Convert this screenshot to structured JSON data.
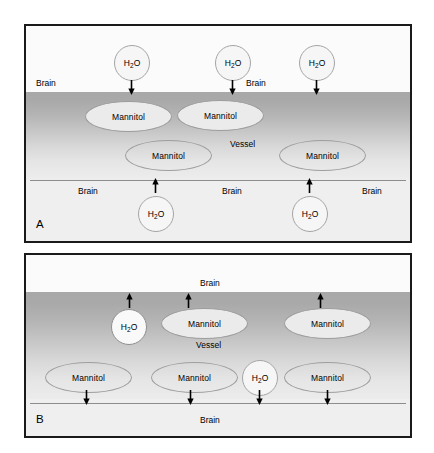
{
  "figure": {
    "type": "diagram",
    "molecule_labels": {
      "water": "H2O",
      "water_formula_main": "H",
      "water_formula_sub": "2",
      "water_formula_tail": "O",
      "mannitol": "Mannitol"
    },
    "region_labels": {
      "brain": "Brain",
      "vessel": "Vessel"
    },
    "colors": {
      "panel_border": "#1a1a1a",
      "vessel_dark": "#a8a8a8",
      "vessel_light": "#ededed",
      "brain_background": "#fbfbfb",
      "wall_line": "#8d8d8d",
      "molecule_outline": "#9a9a9a",
      "text": "#000000"
    }
  },
  "panels": [
    {
      "id": "A",
      "letter": "A",
      "description": "Mannitol within the vessel draws water from the brain into the vessel; arrows point inward toward the vessel lumen.",
      "brain_labels": [
        {
          "text": "Brain",
          "x": 10,
          "y": 52
        },
        {
          "text": "Brain",
          "x": 220,
          "y": 52
        },
        {
          "text": "Brain",
          "x": 52,
          "y": 160
        },
        {
          "text": "Brain",
          "x": 196,
          "y": 160
        },
        {
          "text": "Brain",
          "x": 336,
          "y": 160
        }
      ],
      "vessel_label": {
        "text": "Vessel",
        "x": 204,
        "y": 113
      },
      "molecules": [
        {
          "kind": "water",
          "label": "H2O",
          "x": 88,
          "y": 19,
          "w": 36,
          "h": 36,
          "shade": "on-light"
        },
        {
          "kind": "water",
          "label": "H2O",
          "x": 189,
          "y": 19,
          "w": 36,
          "h": 36,
          "shade": "on-light"
        },
        {
          "kind": "water",
          "label": "H2O",
          "x": 273,
          "y": 19,
          "w": 36,
          "h": 36,
          "shade": "on-light"
        },
        {
          "kind": "mannitol",
          "label": "Mannitol",
          "x": 59,
          "y": 75,
          "w": 87,
          "h": 31,
          "shade": "on-dark"
        },
        {
          "kind": "mannitol",
          "label": "Mannitol",
          "x": 151,
          "y": 74,
          "w": 87,
          "h": 31,
          "shade": "on-dark"
        },
        {
          "kind": "mannitol",
          "label": "Mannitol",
          "x": 99,
          "y": 114,
          "w": 87,
          "h": 31,
          "shade": "on-light"
        },
        {
          "kind": "mannitol",
          "label": "Mannitol",
          "x": 253,
          "y": 114,
          "w": 87,
          "h": 31,
          "shade": "on-light"
        },
        {
          "kind": "water",
          "label": "H2O",
          "x": 112,
          "y": 170,
          "w": 36,
          "h": 36,
          "shade": "on-light"
        },
        {
          "kind": "water",
          "label": "H2O",
          "x": 266,
          "y": 170,
          "w": 36,
          "h": 36,
          "shade": "on-light"
        }
      ],
      "arrows": [
        {
          "direction": "down",
          "x": 101,
          "y": 54,
          "h": 15
        },
        {
          "direction": "down",
          "x": 202,
          "y": 54,
          "h": 15
        },
        {
          "direction": "down",
          "x": 286,
          "y": 54,
          "h": 15
        },
        {
          "direction": "up",
          "x": 125,
          "y": 152,
          "h": 15
        },
        {
          "direction": "up",
          "x": 279,
          "y": 152,
          "h": 15
        }
      ]
    },
    {
      "id": "B",
      "letter": "B",
      "description": "Mannitol and water move out of the vessel into the brain; arrows point outward on both sides.",
      "brain_labels": [
        {
          "text": "Brain",
          "x": 174,
          "y": 23
        },
        {
          "text": "Brain",
          "x": 174,
          "y": 160
        }
      ],
      "vessel_label": {
        "text": "Vessel",
        "x": 170,
        "y": 85
      },
      "molecules": [
        {
          "kind": "water",
          "label": "H2O",
          "x": 85,
          "y": 54,
          "w": 36,
          "h": 36,
          "shade": "on-dark"
        },
        {
          "kind": "mannitol",
          "label": "Mannitol",
          "x": 135,
          "y": 53,
          "w": 87,
          "h": 31,
          "shade": "on-dark"
        },
        {
          "kind": "mannitol",
          "label": "Mannitol",
          "x": 258,
          "y": 53,
          "w": 87,
          "h": 31,
          "shade": "on-dark"
        },
        {
          "kind": "mannitol",
          "label": "Mannitol",
          "x": 19,
          "y": 107,
          "w": 87,
          "h": 31,
          "shade": "on-light"
        },
        {
          "kind": "mannitol",
          "label": "Mannitol",
          "x": 125,
          "y": 107,
          "w": 87,
          "h": 31,
          "shade": "on-light"
        },
        {
          "kind": "water",
          "label": "H2O",
          "x": 216,
          "y": 105,
          "w": 36,
          "h": 36,
          "shade": "on-light"
        },
        {
          "kind": "mannitol",
          "label": "Mannitol",
          "x": 258,
          "y": 107,
          "w": 87,
          "h": 31,
          "shade": "on-light"
        }
      ],
      "arrows": [
        {
          "direction": "up",
          "x": 99,
          "y": 38,
          "h": 15
        },
        {
          "direction": "up",
          "x": 158,
          "y": 38,
          "h": 15
        },
        {
          "direction": "up",
          "x": 290,
          "y": 38,
          "h": 15
        },
        {
          "direction": "down",
          "x": 56,
          "y": 135,
          "h": 15
        },
        {
          "direction": "down",
          "x": 160,
          "y": 135,
          "h": 15
        },
        {
          "direction": "down",
          "x": 229,
          "y": 135,
          "h": 15
        },
        {
          "direction": "down",
          "x": 297,
          "y": 135,
          "h": 15
        }
      ]
    }
  ]
}
